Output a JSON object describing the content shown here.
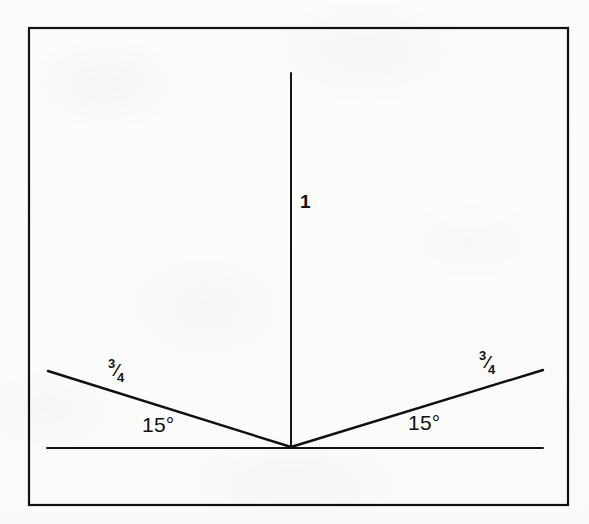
{
  "figure": {
    "background_color": "#fbfbfa",
    "ink_color": "#111111",
    "border": {
      "name": "outer frame",
      "x": 29,
      "y": 28,
      "width": 539,
      "height": 477,
      "stroke_width": 2.2
    },
    "geometry": {
      "vertex": {
        "x": 291,
        "y": 447
      },
      "baseline": {
        "x1": 47,
        "y1": 448,
        "x2": 543,
        "y2": 448,
        "stroke_width": 2
      },
      "vertical": {
        "x1": 291,
        "y1": 73,
        "x2": 291,
        "y2": 447,
        "stroke_width": 2
      },
      "left_ray": {
        "x1": 291,
        "y1": 447,
        "x2": 48,
        "y2": 371,
        "stroke_width": 2.4
      },
      "right_ray": {
        "x1": 291,
        "y1": 447,
        "x2": 543,
        "y2": 370,
        "stroke_width": 2.4
      }
    },
    "labels": {
      "vertical_length": {
        "text": "1",
        "x": 300,
        "y": 192
      },
      "left_side_length": {
        "numerator": "3",
        "slash": "⁄",
        "denominator": "4",
        "text": "3/4",
        "x": 108,
        "y": 358
      },
      "right_side_length": {
        "numerator": "3",
        "slash": "⁄",
        "denominator": "4",
        "text": "3/4",
        "x": 479,
        "y": 350
      },
      "left_angle": {
        "text": "15°",
        "x": 142,
        "y": 414
      },
      "right_angle": {
        "text": "15°",
        "x": 408,
        "y": 412
      }
    }
  }
}
